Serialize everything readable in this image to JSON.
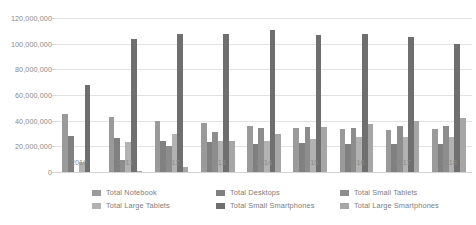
{
  "chart_data": {
    "type": "bar",
    "title": "",
    "subtitle": "",
    "xlabel": "",
    "ylabel": "",
    "grid": true,
    "legend_position": "bottom",
    "ylim": [
      0,
      120000000
    ],
    "yticks": [
      0,
      20000000,
      40000000,
      60000000,
      80000000,
      100000000,
      120000000
    ],
    "ytick_labels": [
      "0",
      "20,000,000",
      "40,000,000",
      "60,000,000",
      "80,000,000",
      "100,000,000",
      "120,000,000"
    ],
    "categories": [
      "2010",
      "2011",
      "2012",
      "2013",
      "2014",
      "2015",
      "2016",
      "2017",
      "2018"
    ],
    "series": [
      {
        "name": "Total Notebook",
        "color": "#9a9a9a",
        "values": [
          45000000,
          42500000,
          39500000,
          38500000,
          36000000,
          34500000,
          33500000,
          32500000,
          33500000
        ]
      },
      {
        "name": "Total Desktops",
        "color": "#808080",
        "values": [
          28000000,
          26500000,
          24500000,
          23000000,
          22000000,
          22500000,
          22000000,
          21500000,
          22000000
        ]
      },
      {
        "name": "Total Small Tablets",
        "color": "#8d8d8d",
        "values": [
          0,
          9500000,
          20500000,
          31500000,
          34000000,
          35000000,
          34500000,
          35500000,
          35500000
        ]
      },
      {
        "name": "Total Large Tablets",
        "color": "#b2b2b2",
        "values": [
          8000000,
          23000000,
          30000000,
          24500000,
          24000000,
          25500000,
          27000000,
          27000000,
          27000000
        ]
      },
      {
        "name": "Total Small Smartphones",
        "color": "#6f6f6f",
        "values": [
          68000000,
          103500000,
          107500000,
          107500000,
          111000000,
          107000000,
          107500000,
          105000000,
          99500000
        ]
      },
      {
        "name": "Total Large Smartphones",
        "color": "#a6a6a6",
        "values": [
          0,
          500000,
          3800000,
          24000000,
          30000000,
          35000000,
          37500000,
          39500000,
          42000000
        ]
      }
    ]
  }
}
